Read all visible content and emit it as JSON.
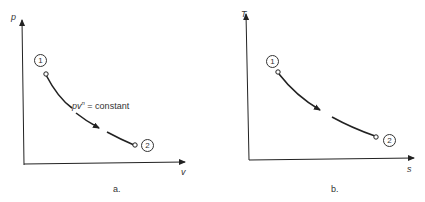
{
  "diagrams": [
    {
      "id": "a",
      "caption": "a.",
      "y_axis_label": "p",
      "x_axis_label": "v",
      "state_1": "1",
      "state_2": "2",
      "process_label_base": "pv",
      "process_label_exp": "n",
      "process_label_rest": " = constant"
    },
    {
      "id": "b",
      "caption": "b.",
      "y_axis_label": "T",
      "x_axis_label": "s",
      "state_1": "1",
      "state_2": "2"
    }
  ],
  "colors": {
    "line": "#222222",
    "background": "#ffffff"
  }
}
